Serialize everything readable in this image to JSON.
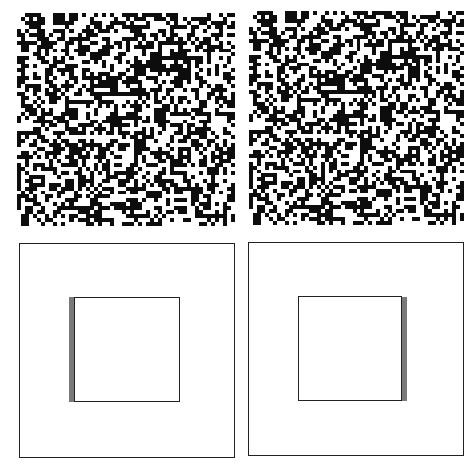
{
  "figure": {
    "colors": {
      "dot": "#0d0d0d",
      "background": "#ffffff",
      "outline": "#222222",
      "disparity_strip": "#7a7a7a"
    },
    "stereogram": {
      "grid_cells": 54,
      "seed": 1337,
      "density": 0.5,
      "center_region": {
        "start_cell": 14,
        "size_cells": 26
      },
      "disparity_cells": 1,
      "panels": [
        {
          "id": "left",
          "x": 17,
          "y": 13,
          "w": 218,
          "h": 213
        },
        {
          "id": "right",
          "x": 249,
          "y": 11,
          "w": 215,
          "h": 214
        }
      ]
    },
    "schematic": {
      "panels": [
        {
          "id": "left",
          "outer": {
            "x": 19,
            "y": 243,
            "w": 216,
            "h": 215
          },
          "inner": {
            "x": 74,
            "y": 297,
            "w": 106,
            "h": 105
          },
          "strip": {
            "x": 69,
            "y": 297,
            "w": 6,
            "h": 105,
            "side": "left"
          }
        },
        {
          "id": "right",
          "outer": {
            "x": 248,
            "y": 242,
            "w": 216,
            "h": 214
          },
          "inner": {
            "x": 298,
            "y": 296,
            "w": 104,
            "h": 105
          },
          "strip": {
            "x": 401,
            "y": 297,
            "w": 6,
            "h": 104,
            "side": "right"
          }
        }
      ]
    }
  }
}
